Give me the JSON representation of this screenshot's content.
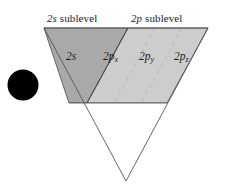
{
  "figure": {
    "title_labels": {
      "s_sublevel": {
        "prefix": "2s",
        "suffix": " sublevel",
        "full": "2s sublevel"
      },
      "p_sublevel": {
        "prefix": "2p",
        "suffix": " sublevel",
        "full": "2p sublevel"
      }
    },
    "orbital_labels": {
      "s": {
        "base": "2s",
        "sub": "",
        "full": "2s"
      },
      "px": {
        "base": "2p",
        "sub": "x",
        "full": "2px"
      },
      "py": {
        "base": "2p",
        "sub": "y",
        "full": "2py"
      },
      "pz": {
        "base": "2p",
        "sub": "z",
        "full": "2pz"
      }
    },
    "nucleus": {
      "name": "nucleus",
      "color": "#000000"
    },
    "colors": {
      "s_region_fill": "#a9a9a9",
      "p_region_fill": "#cdcdcd",
      "outline": "#555555",
      "divider": "#4a4a4a",
      "dashed_divider": "#b0b0b0",
      "background": "#ffffff",
      "text": "#1a1a1a"
    },
    "geometry": {
      "triangle_top_left": [
        44,
        28
      ],
      "triangle_top_right": [
        208,
        28
      ],
      "triangle_apex": [
        126,
        181
      ],
      "band_bottom_y": 103,
      "s_p_divider_top_x": 128,
      "s_p_divider_bottom_x": 87
    }
  }
}
